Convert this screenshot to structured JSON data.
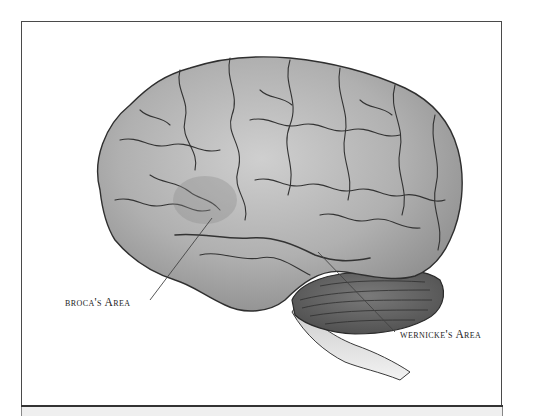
{
  "figure": {
    "labels": [
      {
        "id": "broca",
        "text": "broca's Area"
      },
      {
        "id": "wernicke",
        "text": "wernicke's Area"
      }
    ]
  },
  "colors": {
    "cortex": "#a9a9a9",
    "cortex_highlight": "#d4d4d4",
    "cerebellum": "#5e5e5e",
    "brainstem": "#e2e2e2",
    "outline": "#2f2f2f",
    "frame_border": "#4a4a4a",
    "footer_band": "#efefef"
  }
}
